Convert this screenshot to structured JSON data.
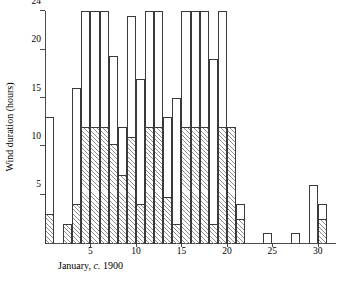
{
  "chart_data": {
    "type": "bar",
    "title": "",
    "xlabel": "January, c. 1900",
    "xlabel_parts": {
      "lead": "January,",
      "italic": "c.",
      "tail": "1900"
    },
    "ylabel": "Wind duration (hours)",
    "xlim": [
      0,
      32
    ],
    "ylim": [
      0,
      24
    ],
    "grid": false,
    "legend": "none",
    "x_ticks": [
      5,
      10,
      15,
      20,
      25,
      30
    ],
    "x_tick_labels": [
      "5",
      "10",
      "15",
      "20",
      "25",
      "30"
    ],
    "y_ticks": [
      5,
      10,
      15,
      20,
      24
    ],
    "y_tick_labels": [
      "5",
      "10",
      "15",
      "20",
      "24"
    ],
    "categories": [
      1,
      2,
      3,
      4,
      5,
      6,
      7,
      8,
      9,
      10,
      11,
      12,
      13,
      14,
      15,
      16,
      17,
      18,
      19,
      20,
      21,
      22,
      23,
      24,
      25,
      26,
      27,
      28,
      29,
      30,
      31
    ],
    "series": [
      {
        "name": "Total wind duration",
        "values": [
          13,
          0,
          2,
          16,
          24,
          24,
          24,
          19.3,
          12,
          23.5,
          17,
          24,
          24,
          13,
          15,
          24,
          24,
          24,
          19,
          24,
          12,
          4,
          0,
          0,
          1,
          0,
          0,
          1,
          0,
          6,
          4
        ]
      },
      {
        "name": "Strong wind duration (hatched)",
        "values": [
          3,
          0,
          2,
          4,
          12,
          12,
          12,
          10.2,
          7,
          11,
          4,
          12,
          12,
          4.8,
          2,
          12,
          12,
          12,
          2,
          12,
          12,
          2.5,
          0,
          0,
          0,
          0,
          0,
          0,
          0,
          0,
          2.5
        ]
      }
    ],
    "bars": [
      {
        "day": 1,
        "total": 13,
        "hatched": 3
      },
      {
        "day": 2,
        "total": 0,
        "hatched": 0
      },
      {
        "day": 3,
        "total": 2,
        "hatched": 2
      },
      {
        "day": 4,
        "total": 16,
        "hatched": 4
      },
      {
        "day": 5,
        "total": 24,
        "hatched": 12
      },
      {
        "day": 6,
        "total": 24,
        "hatched": 12
      },
      {
        "day": 7,
        "total": 24,
        "hatched": 12
      },
      {
        "day": 8,
        "total": 19.3,
        "hatched": 10.2
      },
      {
        "day": 9,
        "total": 12,
        "hatched": 7
      },
      {
        "day": 10,
        "total": 23.5,
        "hatched": 11
      },
      {
        "day": 11,
        "total": 17,
        "hatched": 4
      },
      {
        "day": 12,
        "total": 24,
        "hatched": 12
      },
      {
        "day": 13,
        "total": 24,
        "hatched": 12
      },
      {
        "day": 14,
        "total": 13,
        "hatched": 4.8
      },
      {
        "day": 15,
        "total": 15,
        "hatched": 2
      },
      {
        "day": 16,
        "total": 24,
        "hatched": 12
      },
      {
        "day": 17,
        "total": 24,
        "hatched": 12
      },
      {
        "day": 18,
        "total": 24,
        "hatched": 12
      },
      {
        "day": 19,
        "total": 19,
        "hatched": 2
      },
      {
        "day": 20,
        "total": 24,
        "hatched": 12
      },
      {
        "day": 21,
        "total": 12,
        "hatched": 12
      },
      {
        "day": 22,
        "total": 4,
        "hatched": 2.5
      },
      {
        "day": 23,
        "total": 0,
        "hatched": 0
      },
      {
        "day": 24,
        "total": 0,
        "hatched": 0
      },
      {
        "day": 25,
        "total": 1,
        "hatched": 0
      },
      {
        "day": 26,
        "total": 0,
        "hatched": 0
      },
      {
        "day": 27,
        "total": 0,
        "hatched": 0
      },
      {
        "day": 28,
        "total": 1,
        "hatched": 0
      },
      {
        "day": 29,
        "total": 0,
        "hatched": 0
      },
      {
        "day": 30,
        "total": 6,
        "hatched": 0
      },
      {
        "day": 31,
        "total": 4,
        "hatched": 2.5
      }
    ]
  },
  "colors": {
    "axis": "#4a4a4a",
    "bar_outline": "#3a3a3a",
    "bar_fill": "#ffffff",
    "hatch": "#8e8e8e",
    "background": "#ffffff"
  }
}
